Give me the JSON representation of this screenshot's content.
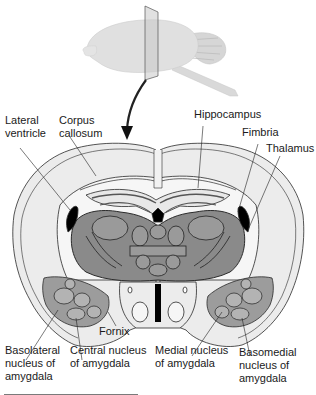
{
  "figure": {
    "type": "brain-coronal-section",
    "colors": {
      "background": "#ffffff",
      "outer_tissue": "#ececec",
      "white_matter": "#f6f6f6",
      "thalamus_gray": "#8a8a8a",
      "amygdala_gray": "#9c9c9c",
      "outline": "#2a2a2a",
      "ventricle": "#000000",
      "brain_3d": "#dcdcdc"
    }
  },
  "labels": {
    "lateral_ventricle": "Lateral\nventricle",
    "corpus_callosum": "Corpus\ncallosum",
    "hippocampus": "Hippocampus",
    "fimbria": "Fimbria",
    "thalamus": "Thalamus",
    "fornix": "Fornix",
    "basolateral_nucleus": "Basolateral\nnucleus of\namygdala",
    "central_nucleus": "Central nucleus\nof amygdala",
    "medial_nucleus": "Medial nucleus\nof amygdala",
    "basomedial_nucleus": "Basomedial\nnucleus of\namygdala"
  }
}
